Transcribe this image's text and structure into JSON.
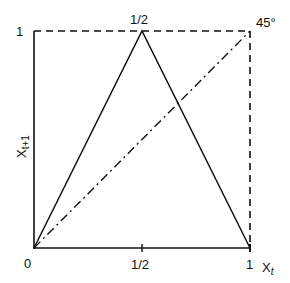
{
  "figure": {
    "type": "tent-map",
    "x_axis": {
      "label": "X",
      "label_sub": "t",
      "ticks": [
        "0",
        "1/2",
        "1"
      ]
    },
    "y_axis": {
      "label": "X",
      "label_sub": "t+1",
      "ticks": [
        "1"
      ]
    },
    "peak_label": "1/2",
    "diagonal_label": "45°",
    "curves": [
      {
        "name": "tent-map",
        "style": "solid",
        "points": [
          [
            0,
            0
          ],
          [
            0.5,
            1
          ],
          [
            1,
            0
          ]
        ]
      },
      {
        "name": "45-degree-line",
        "style": "dash-dot",
        "points": [
          [
            0,
            0
          ],
          [
            1,
            1
          ]
        ]
      },
      {
        "name": "unit-box-top",
        "style": "dashed",
        "points": [
          [
            0,
            1
          ],
          [
            1,
            1
          ]
        ]
      },
      {
        "name": "unit-box-right",
        "style": "dashed",
        "points": [
          [
            1,
            1
          ],
          [
            1,
            0
          ]
        ]
      }
    ]
  }
}
